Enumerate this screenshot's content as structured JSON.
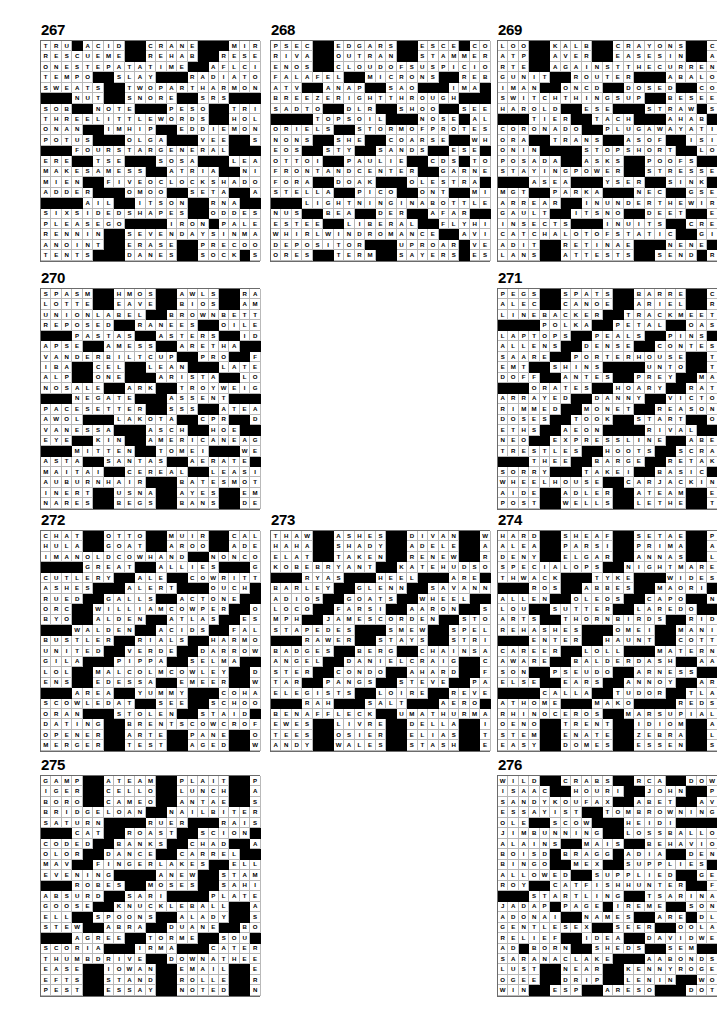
{
  "page": {
    "type": "crossword-answer-key-page",
    "puzzle_count": 10,
    "grid_size": 21
  },
  "legend": {
    "black_square_char": "#",
    "note": "Each puzzle is a 21x21 filled crossword answer grid. '#' marks a black (blocked) square."
  },
  "puzzles": [
    {
      "number": "267",
      "rows": [
        "TRU#ACID##CRANE###MIROS",
        "RESCUEME##REHAB##RESENT",
        "ONESTEPATATIME##AFLCIO",
        "TEMPO##SLAY###RADIATOR",
        "SWEATS##TWOPARTHARMONY",
        "###NUT##SNORE##SRS####",
        "SOB##NOTE###PESO##TRICK",
        "THREELITTLEWORDS##HOLE",
        "ONAN##IMHIP##EDDIEMONEY",
        "POTUS###OLGA###VEE##SOS",
        "###FOURSTARGENERAL####",
        "ERE##TSE###SOSA###LEAKS",
        "MAKESAMESS##ATRIA##NINA",
        "MIEN##FIVEOCLOCKSHADOW",
        "ADDER###OMOO##SETA##AWN",
        "####AIL##ITSON##RNA###",
        "SIXSIDEDSHAPES##ODDEST",
        "PLEASEGO####IRON#PALER",
        "RENNIN##SEVENDAYSINMAY",
        "ANOINT##ERASE##PRECOOLS",
        "TENTS###DANES##SOCK#SST"
      ]
    },
    {
      "number": "268",
      "rows": [
        "PSEC##EDGARS##ESCE#CORP",
        "RIVA##OUTRAN##STAMMERER",
        "ENOS##CLOUDOFSUSPICION",
        "FALAFEL##MICRONS##REBID",
        "ATV##ANAP##SAO###IMA#ILL",
        "BREEZERIGHTTHROUGH####",
        "SADTO##DLR##SHOO##SEESUP",
        "####TOPSOIL###NOSE#ALPO",
        "ORIELS##STORMOFPROTEST",
        "NONS##SHE##COARSE##WHETS",
        "EOS##STY##SANDS##ESE#PAH",
        "OTTOI##PAULIE##CDS#TOTO",
        "FRONTANDCENTER##GARNET",
        "FORA##DOAK###OLESTRA###",
        "STELLA##PICO##ONT##MISER",
        "###LIGHTNINGINABOTTLE",
        "NUS##BEA##DER##AFAR##RES",
        "ESTEE##LIBERAL##FLYHIGH",
        "WHIRLWINDROMANCE##AVIA",
        "DEPOSITOR###UPROAR#VEEP",
        "ORES##TERM##SAYERS#ESSE"
      ]
    },
    {
      "number": "269",
      "rows": [
        "LOO##KALB##CRAYONS##CANA",
        "ATP##AVER##EASESIN##ARAN",
        "RTE##AGAINSTTHECURRENT",
        "GUNIT##ROUTER###ABALONE",
        "IMAN##ONCD##DOSED##COLIN",
        "SWITCHTHINGSUP##BESEEN",
        "HAROLD##ESE###STRAW#SSA",
        "###TIER##TACH###AHAB###",
        "CORONADO##PLUGAWAYATIT",
        "ORA##TRANS##ASOF##ISITME",
        "ONIN####STOPSHORT##LOBE",
        "POSADA##ASKS##POOFS##PUN",
        "STAYINGPOWER##STRESSES",
        "###ASEA###YSER##SINK###",
        "MGT##PARKA###NEC##GSEVEN",
        "ARREAR##INUNDERTHEWIRE",
        "GAULT##ITSNO##DEET##ENOS",
        "INSECTS###INUITS##CREST",
        "CATCHALOTOFSTATIC##GIL",
        "ADIT##RETINAE###NENE#AVE",
        "LANS##ATTESTS##SEND#RED"
      ]
    },
    {
      "number": "270",
      "rows": [
        "SPASM##HMOS##AWLS##RAGES",
        "LOTTE##EAVE##BIOS##AMANA",
        "UNIONLABEL##BROWNBETTY",
        "REPOSED##RANEES##OILERS",
        "###PASTAS##ASTERS##IDEO",
        "APSE##AMESS##ARETHA####",
        "VANDERBILTCUP##PRO##FEB",
        "IBA##CEL##LEAN###LATERAL",
        "ALP##ONE###ARISTA##LOCO",
        "NOSALE##ARK##TROYWEIGHT",
        "###NEGATE###ASSENT####",
        "PACESETTER##SSS##ATEASE",
        "AWOL###LAKOTA##CPR##DIN",
        "VANESSA###ASCH##HOE##ADD",
        "EYE##KIN##AMERICANEAGLE",
        "###MITTEN##TOMEI###WEED",
        "ASTA##SANTAS##AERATE###",
        "MAITAI##CEREAL##LEASING",
        "AUBURNHAIR###BATESMOTEL",
        "INERT##USNA##AYES##EMOTE",
        "NARES##BEGS##BANS##DENSE"
      ]
    },
    {
      "number": "271",
      "rows": [
        "PEGS##SPATS##BARRE##CLAM",
        "ALEC##CANOE##ARIEL##RISE",
        "LINEBACKER##TRACKMEETS",
        "####POLKA##PETAL##OASIS",
        "LAPTOPS##PEALS##PINS####",
        "ALLENS##DENSE##CONTESSA",
        "SAARE##PORTERHOUSE##TEN",
        "EMT##SHINS####UNTO##TACT",
        "DOFF##ANTES##PREY##MATTO",
        "###ORATES##HOARY##RATION",
        "ARRAYED##DANNY##VICTORY",
        "RIMMED##MONET##REASON###",
        "DOSES##TOOK##START##OBEY",
        "ETHS##AEON####RIVAL##RTE",
        "NEO##EXPRESSLINE##ABEAM",
        "TRESTLES##HOOTS##SCRAPE",
        "###THEE##BARGE##RETAKEN",
        "SORRY###TAKEI##BASIC####",
        "WHEELHOUSE##CARJACKING",
        "AIDE##ADLER##ATEAM##ERIE",
        "POST##WELLS##LETHE##TEXT"
      ]
    },
    {
      "number": "272",
      "rows": [
        "CHAT##OTTO##MUIR##CALASH",
        "HULA##GOAT##AROO##ADESTE",
        "IMANOLDCOWHAND##NONCOM",
        "####GREAT##ALLIES###GORE",
        "CUTLERY##ALE##COWRITTEN",
        "ASHES###ALERT###OUCH####",
        "RUED##GALLS##ACTONE##MET",
        "ORC##WILLIAMCOWPER##OLE",
        "BYO##ALDEN##ATLAS##ESTE",
        "###WALDEN##ACIDS##FALCON",
        "BUSTLER##RIALS##HARMONY",
        "UNITED##VERDE##DARROW###",
        "GILA###PIPPA##SELMA##IVE",
        "LOL##MALCOLMCOWLEY##DOT",
        "ENS##EDESSA##EMEER##WACO",
        "###AREA##YUMMY###COHAN",
        "SCOWLEDAT##SEE##SCHOOLS",
        "ORAN###STOLEN##STAID####",
        "DATING##BRENTSCOWCROFT",
        "OPENER##ARTE##PANE##OBOE",
        "MERGER##TEST##AGED##WIPE"
      ]
    },
    {
      "number": "273",
      "rows": [
        "THAW##ASHES##DIVAN##WELL",
        "HAHA##SHADY##ADELE##AGIO",
        "ELAT##TAKEN##RENEW##ROMA",
        "KOBEBRYANT##KATEHUDSON",
        "###RYAS###HEEL###ARE####",
        "BARLEY##GLENN##SAVANNAH",
        "ADIOS##GOATS##WHEEL##ITA",
        "LOCO##FARSI##AARON##SCOT",
        "MPH##JAMESCORDEN##STOLE",
        "STAPEDES###SMEW##SPELLS",
        "###RAWER##STAYS##STRIA##",
        "BADGES##BERG##CHAINSAW",
        "ANGEL##DANIELCRAIG##CSA",
        "STER##CONDO##AHARD##FATS",
        "TAR##PANGS##STEVE##PAGET",
        "ELEGISTS##LOIRE##REVERE",
        "###RAH###SALT###AERO###",
        "BENAFFLECK##UMATHURMAN",
        "EWES##LIVRE##DELLA##IOWA",
        "TEES##OSIER##ELIAS##TORN",
        "ANDY##WALES##STASH##ENYA"
      ]
    },
    {
      "number": "274",
      "rows": [
        "HARD##SHEAF##SETAE##PITA",
        "ALEA##PARSI##PRIMA##ANON",
        "DENY##ELGAR##ANNAS##LUNG",
        "SPECIALOPS##NIGHTMARES",
        "THWACK###TYKE###WIDEST",
        "###ROS##ABBES##MAORI####",
        "ALLEN##OLEOS##CAPO##NIKE",
        "LOU##SUTTER##LAREDO##NIL",
        "ARTS##THORNBIRDS##RIDES",
        "REHASHES###OMEI##MANILA",
        "###ENTER##HAUNT##COTTA##",
        "CAREER##LOLL###MATERNAL",
        "AWARE##BALDERDASH##AARE",
        "SON##PSEUDO##ARNESS##NCO",
        "ELSE##EARS##ANNOY##ARSON",
        "####CALLA##TUDOR##TLA###",
        "ATHOME###MAKO####REDSEA",
        "RHINOCEROS##MARSUPIALS",
        "OENO##TRENT##IDIOM##ARIP",
        "STEM##ENATE##ZEBRA##LATE",
        "EASY##DOMES##ESSEN##SHEN"
      ]
    },
    {
      "number": "275",
      "rows": [
        "GAMP##ATEAM##PLAIT##PAST",
        "IGER##CELLO##LUNCH##ALAR",
        "BORO##CAMEO##ANTAE##SOBE",
        "BRIDGELOAN##NAILBITERS",
        "SATURN####RUER###RAISES",
        "###CAT##ROAST##SCION####",
        "CODED##BANKS##CHAD##APSE",
        "OLOR##DANCE##CARREL##ATO",
        "MAV##FINGERLAKES##ELLEN",
        "EVENING####ANEW##STAMPS",
        "###ROBES##MOSES##SAHIB##",
        "ABSURD##SARI####PLATEAU",
        "GOOSE##KNUCKLEBALL##ADS",
        "ELL##SPOONS##ALADY##SCUT",
        "STEW##ABRA##DUANE##BOHEA",
        "###AGREE##TORME##SOU###",
        "SCORIA###IRMA###CATERS",
        "THUMBDRIVE##DOWNATHEEL",
        "EASE##IOWAN##EMAIL##ERSE",
        "EFTS##STAND##ROLLE##RITE",
        "PEST##ESSAY##NOTED##NEST"
      ]
    },
    {
      "number": "276",
      "rows": [
        "WILD##CRABS##RCA##DOW",
        "ISAAC##HOURI##JOHN##PATE",
        "SANDYKOUFAX##ABET##AVON",
        "ESSAYIST##TOMBROWNING",
        "OLE##SCOW###HEIDI####",
        "JIMBUNNING##LOSSBALLOA",
        "ALAINS##MAIS##BEHAVIORS",
        "BOISD#BRAGG#ADIA##DENNIS",
        "BINGO##MEX##SUPPLIES##",
        "ALLOWED##SUPPLIED##GENE",
        "ROY##CATFISHHUNTER##FON",
        "###STARTLING##TSARINA",
        "JADAP#PAGE#IREME##SONE",
        "ADONAI##NAMES##ARE#DLIII",
        "GENTLESEX##SEER##OOLALA",
        "RELIEF##IDEA##DAVIDWELLS",
        "AD#BORN##SHEDS##SEM",
        "SARANACLAKE###AABONDS",
        "LUST##NEAR##KENNYROGERS",
        "OGEE##DRIP##LENIN##WOMAN",
        "WIN##ESP##ARESO###DOTS"
      ]
    }
  ],
  "layout": {
    "columns": 3,
    "rows": 4,
    "positions": [
      {
        "number": "267",
        "col": 0,
        "row": 0
      },
      {
        "number": "268",
        "col": 1,
        "row": 0
      },
      {
        "number": "269",
        "col": 2,
        "row": 0
      },
      {
        "number": "270",
        "col": 0,
        "row": 1
      },
      {
        "number": "271",
        "col": 2,
        "row": 1
      },
      {
        "number": "272",
        "col": 0,
        "row": 2
      },
      {
        "number": "273",
        "col": 1,
        "row": 2
      },
      {
        "number": "274",
        "col": 2,
        "row": 2
      },
      {
        "number": "275",
        "col": 0,
        "row": 3
      },
      {
        "number": "276",
        "col": 2,
        "row": 3
      }
    ]
  },
  "colors": {
    "black_square": "#000000",
    "white_square": "#ffffff",
    "grid_line": "#b9b9b9",
    "grid_border": "#6b6b6b",
    "text": "#000000"
  }
}
